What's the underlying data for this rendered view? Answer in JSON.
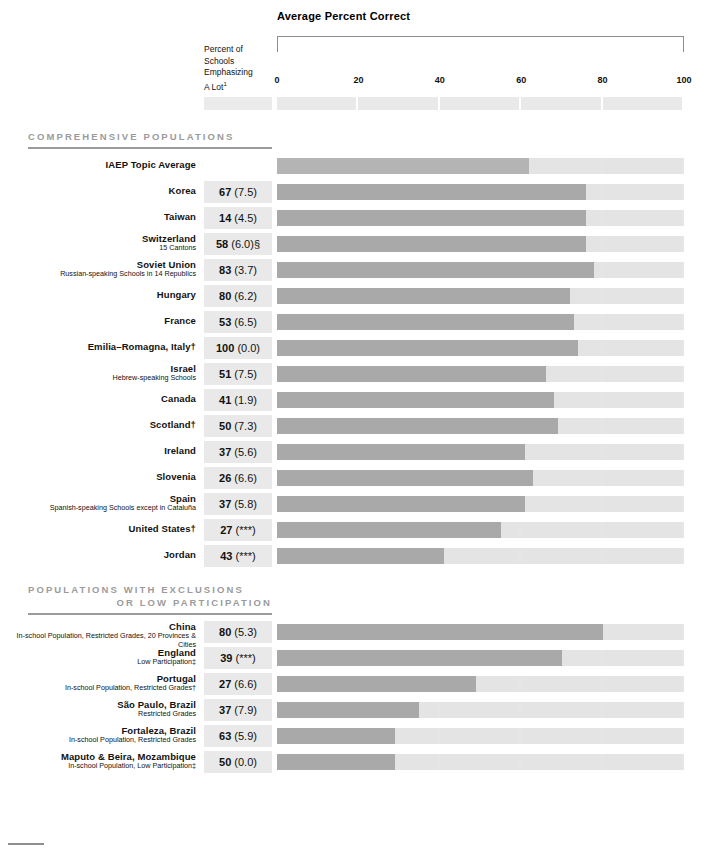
{
  "header": {
    "chart_title": "Average Percent Correct",
    "column_header_lines": [
      "Percent of",
      "Schools",
      "Emphasizing",
      "A Lot"
    ],
    "column_header_superscript": "1"
  },
  "axis": {
    "ticks": [
      "0",
      "20",
      "40",
      "60",
      "80",
      "100"
    ],
    "min": 0,
    "max": 100
  },
  "sections": [
    {
      "id": "comprehensive",
      "title_lines": [
        "COMPREHENSIVE POPULATIONS"
      ]
    },
    {
      "id": "exclusions",
      "title_lines": [
        "POPULATIONS WITH EXCLUSIONS",
        "OR LOW PARTICIPATION"
      ]
    }
  ],
  "chart_data": {
    "type": "bar",
    "title": "Average Percent Correct",
    "xlabel": "Average Percent Correct",
    "ylabel": "",
    "xlim": [
      0,
      100
    ],
    "grid": false,
    "legend": "none",
    "orientation": "horizontal",
    "columns": [
      "Population",
      "Percent of Schools Emphasizing A Lot",
      "Average Percent Correct"
    ],
    "groups": [
      {
        "name": "COMPREHENSIVE POPULATIONS",
        "rows": [
          {
            "label": "IAEP Topic Average",
            "sublabel": "",
            "percent": "",
            "se": "",
            "pct_display": "",
            "value": 62
          },
          {
            "label": "Korea",
            "sublabel": "",
            "percent": "67",
            "se": "(7.5)",
            "pct_display": "67 (7.5)",
            "value": 76
          },
          {
            "label": "Taiwan",
            "sublabel": "",
            "percent": "14",
            "se": "(4.5)",
            "pct_display": "14 (4.5)",
            "value": 76
          },
          {
            "label": "Switzerland",
            "sublabel": "15 Cantons",
            "percent": "58",
            "se": "(6.0)§",
            "pct_display": "58 (6.0)§",
            "value": 76
          },
          {
            "label": "Soviet Union",
            "sublabel": "Russian-speaking Schools in 14 Republics",
            "percent": "83",
            "se": "(3.7)",
            "pct_display": "83 (3.7)",
            "value": 78
          },
          {
            "label": "Hungary",
            "sublabel": "",
            "percent": "80",
            "se": "(6.2)",
            "pct_display": "80 (6.2)",
            "value": 72
          },
          {
            "label": "France",
            "sublabel": "",
            "percent": "53",
            "se": "(6.5)",
            "pct_display": "53 (6.5)",
            "value": 73
          },
          {
            "label": "Emilia–Romagna, Italy†",
            "sublabel": "",
            "percent": "100",
            "se": "(0.0)",
            "pct_display": "100 (0.0)",
            "value": 74
          },
          {
            "label": "Israel",
            "sublabel": "Hebrew-speaking Schools",
            "percent": "51",
            "se": "(7.5)",
            "pct_display": "51 (7.5)",
            "value": 66
          },
          {
            "label": "Canada",
            "sublabel": "",
            "percent": "41",
            "se": "(1.9)",
            "pct_display": "41 (1.9)",
            "value": 68
          },
          {
            "label": "Scotland†",
            "sublabel": "",
            "percent": "50",
            "se": "(7.3)",
            "pct_display": "50 (7.3)",
            "value": 69
          },
          {
            "label": "Ireland",
            "sublabel": "",
            "percent": "37",
            "se": "(5.6)",
            "pct_display": "37 (5.6)",
            "value": 61
          },
          {
            "label": "Slovenia",
            "sublabel": "",
            "percent": "26",
            "se": "(6.6)",
            "pct_display": "26 (6.6)",
            "value": 63
          },
          {
            "label": "Spain",
            "sublabel": "Spanish-speaking Schools except in Cataluña",
            "percent": "37",
            "se": "(5.8)",
            "pct_display": "37 (5.8)",
            "value": 61
          },
          {
            "label": "United States†",
            "sublabel": "",
            "percent": "27",
            "se": "(***)",
            "pct_display": "27 (***)",
            "value": 55
          },
          {
            "label": "Jordan",
            "sublabel": "",
            "percent": "43",
            "se": "(***)",
            "pct_display": "43 (***)",
            "value": 41
          }
        ]
      },
      {
        "name": "POPULATIONS WITH EXCLUSIONS OR LOW PARTICIPATION",
        "rows": [
          {
            "label": "China",
            "sublabel": "In-school Population, Restricted Grades, 20 Provinces & Cities",
            "percent": "80",
            "se": "(5.3)",
            "pct_display": "80 (5.3)",
            "value": 80
          },
          {
            "label": "England",
            "sublabel": "Low Participation‡",
            "percent": "39",
            "se": "(***)",
            "pct_display": "39 (***)",
            "value": 70
          },
          {
            "label": "Portugal",
            "sublabel": "In-school Population, Restricted  Grades†",
            "percent": "27",
            "se": "(6.6)",
            "pct_display": "27 (6.6)",
            "value": 49
          },
          {
            "label": "São Paulo, Brazil",
            "sublabel": "Restricted Grades",
            "percent": "37",
            "se": "(7.9)",
            "pct_display": "37 (7.9)",
            "value": 35
          },
          {
            "label": "Fortaleza, Brazil",
            "sublabel": "In-school Population, Restricted Grades",
            "percent": "63",
            "se": "(5.9)",
            "pct_display": "63 (5.9)",
            "value": 29
          },
          {
            "label": "Maputo & Beira, Mozambique",
            "sublabel": "In-school Population, Low Participation‡",
            "percent": "50",
            "se": "(0.0)",
            "pct_display": "50 (0.0)",
            "value": 29
          }
        ]
      }
    ]
  },
  "colors": {
    "bar_fill": "#a9a9a9",
    "bar_track": "#e6e6e6",
    "pct_box": "#e9e9e9",
    "section_heading": "#9b9b9b",
    "axis_rule": "#8e8e8e",
    "text": "#111111"
  }
}
